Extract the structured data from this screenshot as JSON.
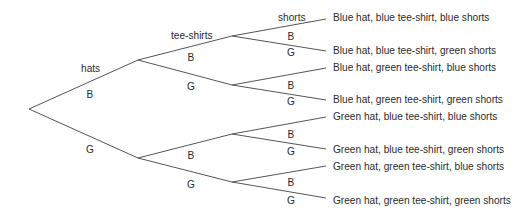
{
  "diagram": {
    "type": "tree",
    "level_headers": {
      "hats": "hats",
      "tee_shirts": "tee-shirts",
      "shorts": "shorts"
    },
    "hats": [
      {
        "label": "B"
      },
      {
        "label": "G"
      }
    ],
    "tee_shirts": [
      {
        "label": "B"
      },
      {
        "label": "G"
      },
      {
        "label": "B"
      },
      {
        "label": "G"
      }
    ],
    "shorts": [
      {
        "label": "B"
      },
      {
        "label": "G"
      },
      {
        "label": "B"
      },
      {
        "label": "G"
      },
      {
        "label": "B"
      },
      {
        "label": "G"
      },
      {
        "label": "B"
      },
      {
        "label": "G"
      }
    ],
    "outcomes": [
      "Blue hat, blue tee-shirt, blue shorts",
      "Blue hat, blue tee-shirt, green shorts",
      "Blue hat, green tee-shirt, blue shorts",
      "Blue hat, green tee-shirt, green shorts",
      "Green hat, blue tee-shirt, blue shorts",
      "Green hat, blue tee-shirt, green shorts",
      "Green hat, green tee-shirt, blue shorts",
      "Green hat, green tee-shirt, green shorts"
    ],
    "line_color": "#555555"
  }
}
